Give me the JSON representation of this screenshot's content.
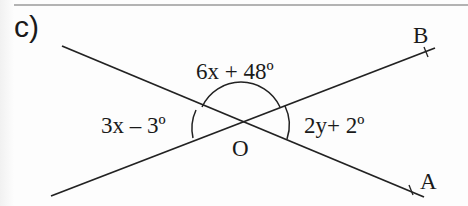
{
  "part": {
    "label": "c)"
  },
  "angles": {
    "top": "6x + 48º",
    "left": "3x – 3º",
    "right": "2y+ 2º"
  },
  "points": {
    "center": "O",
    "end_a": "A",
    "end_b": "B"
  },
  "figure": {
    "type": "two intersecting lines with vertical and adjacent angles marked",
    "intersection": "O",
    "rays_labeled": [
      "OA",
      "OB"
    ],
    "angle_arcs": [
      "top (6x + 48º)",
      "left (3x – 3º)",
      "right (2y+ 2º)"
    ],
    "line_color": "#222222"
  }
}
